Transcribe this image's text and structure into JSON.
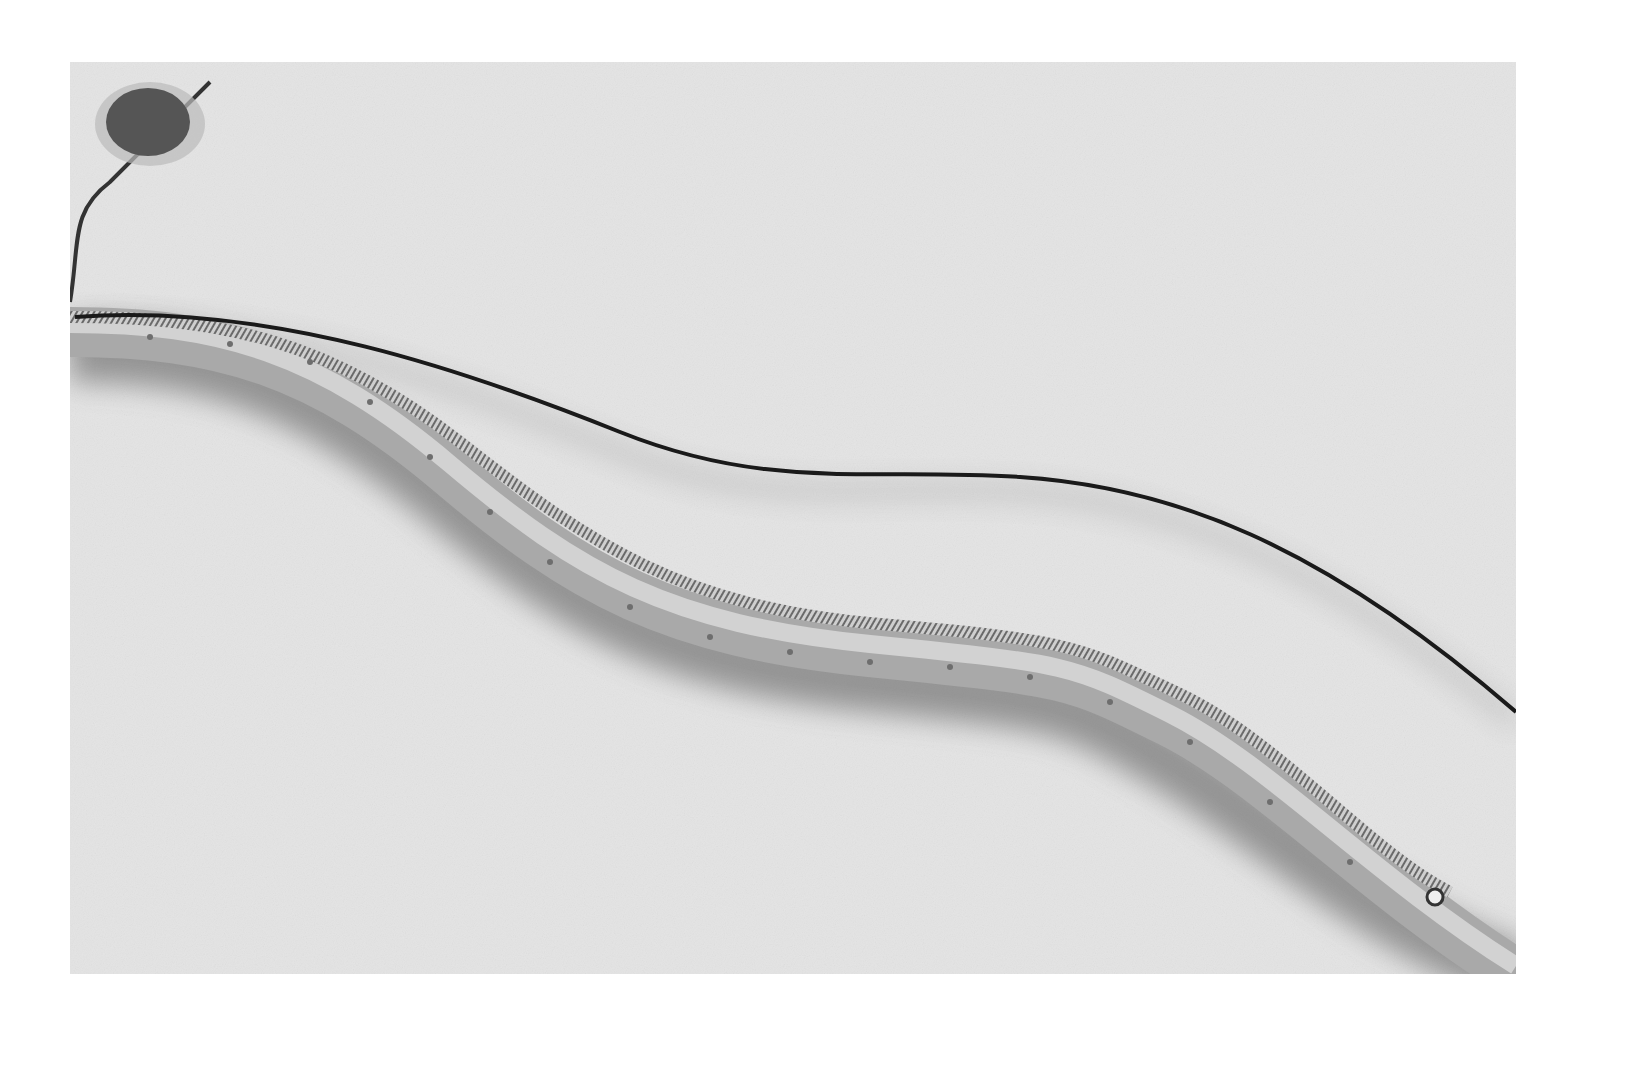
{
  "image": {
    "description": "Grayscale photograph of a long curved catheter/lead device with a spiral coil and a thin trailing wire, a round disc at the upper-left end",
    "colors": {
      "background": "#ffffff",
      "surface": "#e6e6e6",
      "tube": "#bdbdbd",
      "wire": "#1a1a1a",
      "disc": "#555555"
    }
  }
}
